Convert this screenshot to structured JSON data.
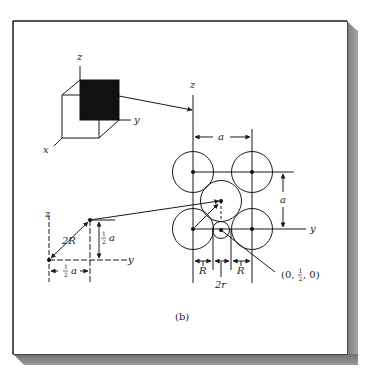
{
  "figure": {
    "caption": "(b)",
    "cube": {
      "axes": {
        "z": "z",
        "y": "y",
        "x": "x"
      }
    },
    "plane": {
      "axes": {
        "z": "z",
        "y": "y"
      },
      "dimension_top": "a",
      "dimension_right": "a",
      "bottom_dims": {
        "left": "R",
        "middle": "2r",
        "right": "R"
      },
      "point_label": "(0, ½, 0)",
      "point_label_parts": {
        "open": "(0, ",
        "num": "1",
        "den": "2",
        "close": ", 0)"
      }
    },
    "triangle": {
      "axes": {
        "z": "z",
        "y": "y"
      },
      "hypotenuse": "2R",
      "vertical_leg": {
        "num": "1",
        "den": "2",
        "var": "a"
      },
      "horizontal_leg": {
        "num": "1",
        "den": "2",
        "var": "a"
      }
    }
  },
  "colors": {
    "ink": "#1a1a1a",
    "page": "#ffffff",
    "shadow": "#8a8a8a"
  }
}
